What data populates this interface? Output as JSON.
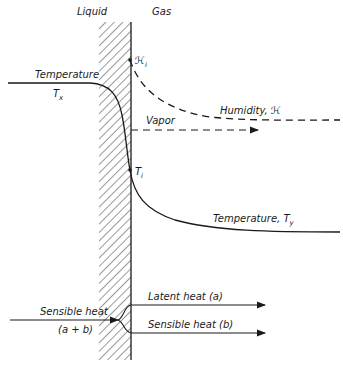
{
  "diagram": {
    "regions": {
      "liquid": "Liquid",
      "gas": "Gas"
    },
    "labels": {
      "temperature_liquid": "Temperature",
      "tx_main": "T",
      "tx_sub": "x",
      "hi_main": "ℋ",
      "hi_sub": "i",
      "humidity": "Humidity, ℋ",
      "vapor": "Vapor",
      "ti_main": "T",
      "ti_sub": "i",
      "temperature_gas": "Temperature, T",
      "ty_sub": "y",
      "sensible_in": "Sensible heat",
      "sensible_in_sum": "(a + b)",
      "latent_out": "Latent heat (a)",
      "sensible_out": "Sensible heat (b)"
    },
    "colors": {
      "ink": "#1a1a1a",
      "background": "#ffffff"
    }
  }
}
